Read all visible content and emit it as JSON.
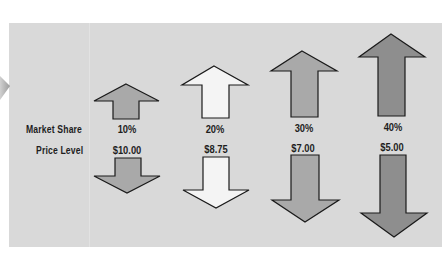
{
  "diagram": {
    "row_labels": {
      "market_share": "Market Share",
      "price_level": "Price Level"
    },
    "columns": [
      {
        "market_share": "10%",
        "price_level": "$10.00",
        "up_fill": "#a9a9a9",
        "down_fill": "#a9a9a9"
      },
      {
        "market_share": "20%",
        "price_level": "$8.75",
        "up_fill": "#f4f4f4",
        "down_fill": "#f4f4f4"
      },
      {
        "market_share": "30%",
        "price_level": "$7.00",
        "up_fill": "#a9a9a9",
        "down_fill": "#a9a9a9"
      },
      {
        "market_share": "40%",
        "price_level": "$5.00",
        "up_fill": "#8e8e8e",
        "down_fill": "#8e8e8e"
      }
    ],
    "colors": {
      "panel_bg": "#d9d9d9",
      "page_bg": "#ffffff",
      "arrow_stroke": "#1a1a1a",
      "text": "#1e1e1e"
    }
  }
}
